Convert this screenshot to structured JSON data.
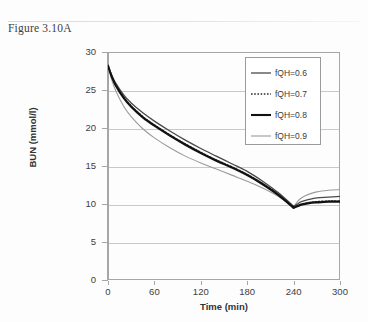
{
  "caption": "Figure 3.10A",
  "chart_data": {
    "type": "line",
    "title": "",
    "xlabel": "Time (min)",
    "ylabel": "BUN (mmol/l)",
    "xlim": [
      0,
      300
    ],
    "ylim": [
      0,
      30
    ],
    "xticks": [
      0,
      60,
      120,
      180,
      240,
      300
    ],
    "yticks": [
      0,
      5,
      10,
      15,
      20,
      25,
      30
    ],
    "grid": "horizontal",
    "legend_position": "top-right",
    "x": [
      0,
      5,
      10,
      20,
      30,
      45,
      60,
      80,
      100,
      120,
      140,
      160,
      180,
      200,
      220,
      240,
      245,
      250,
      260,
      270,
      285,
      300
    ],
    "series": [
      {
        "name": "fQH=0.6",
        "label": "fQH=0.6",
        "style": "solid",
        "color": "#4a4a4a",
        "width": 1.3,
        "values": [
          28.2,
          26.9,
          25.9,
          24.4,
          23.3,
          22.0,
          20.9,
          19.6,
          18.4,
          17.3,
          16.3,
          15.3,
          14.3,
          13.0,
          11.5,
          9.7,
          10.0,
          10.3,
          10.6,
          10.8,
          10.9,
          11.0
        ]
      },
      {
        "name": "fQH=0.7",
        "label": "fQH=0.7",
        "style": "dotted",
        "color": "#2e2e2e",
        "width": 1.5,
        "values": [
          28.2,
          26.8,
          25.7,
          24.1,
          22.9,
          21.5,
          20.4,
          19.1,
          17.9,
          16.8,
          15.8,
          14.9,
          13.9,
          12.7,
          11.3,
          9.6,
          9.8,
          10.0,
          10.2,
          10.3,
          10.4,
          10.4
        ]
      },
      {
        "name": "fQH=0.8",
        "label": "fQH=0.8",
        "style": "solid",
        "color": "#111111",
        "width": 2.1,
        "values": [
          28.2,
          26.7,
          25.6,
          24.0,
          22.8,
          21.4,
          20.3,
          19.0,
          17.8,
          16.7,
          15.7,
          14.8,
          13.8,
          12.6,
          11.2,
          9.5,
          9.7,
          9.9,
          10.1,
          10.2,
          10.3,
          10.3
        ]
      },
      {
        "name": "fQH=0.9",
        "label": "fQH=0.9",
        "style": "solid",
        "color": "#9b9b9b",
        "width": 1.1,
        "values": [
          28.2,
          26.3,
          24.9,
          22.9,
          21.5,
          19.9,
          18.7,
          17.4,
          16.3,
          15.4,
          14.6,
          13.8,
          13.0,
          12.1,
          11.0,
          9.6,
          10.3,
          10.8,
          11.3,
          11.6,
          11.8,
          11.9
        ]
      }
    ]
  }
}
